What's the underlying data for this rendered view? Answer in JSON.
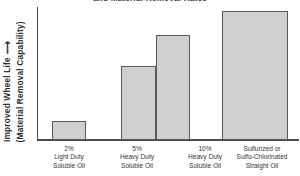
{
  "chart_data": {
    "type": "bar",
    "title": "and Material Removal Rates",
    "xlabel": "",
    "ylabel": "Improved Wheel Life ⟶ (Material Removal Capability)",
    "ylabel_lines": [
      "Improved Wheel Life",
      "(Material Removal Capability)"
    ],
    "grid": false,
    "legend": "none",
    "ylim": [
      0,
      100
    ],
    "y_axis_ticks": [],
    "categories": [
      "2% Light Duty Soluble Oil",
      "5% Heavy Duty Soluble Oil",
      "10% Heavy Duty Soluble Oil",
      "Sulfurized or Sulfo-Chlorinated Straight Oil"
    ],
    "category_label_lines": [
      [
        "2%",
        "Light Duty",
        "Soluble Oil"
      ],
      [
        "5%",
        "Heavy Duty",
        "Soluble Oil"
      ],
      [
        "10%",
        "Heavy Duty",
        "Soluble Oil"
      ],
      [
        "Sulfurized or",
        "Sulfo-Chlorinated",
        "Straight Oil"
      ]
    ],
    "values": [
      15,
      57,
      81,
      100
    ],
    "value_unit": "relative",
    "colors": {
      "bar_fill": "#cfcfcf",
      "bar_border": "#5a5a5a",
      "axis": "#4a4a4a",
      "text": "#343434",
      "background": "#ffffff"
    }
  },
  "bars": [
    {
      "name": "bar-2-percent-light-duty-soluble-oil",
      "left": 52,
      "width": 34,
      "top": 121,
      "value": 15
    },
    {
      "name": "bar-5-percent-heavy-duty-soluble-oil",
      "left": 121,
      "width": 35,
      "top": 66,
      "value": 57
    },
    {
      "name": "bar-10-percent-heavy-duty-soluble-oil",
      "left": 156,
      "width": 34,
      "top": 35,
      "value": 81
    },
    {
      "name": "bar-sulfurized-sulfo-chlorinated-straight-oil",
      "left": 222,
      "width": 66,
      "top": 11,
      "value": 100
    }
  ],
  "label_slots": [
    {
      "left": 36,
      "width": 66
    },
    {
      "left": 103,
      "width": 68
    },
    {
      "left": 172,
      "width": 66
    },
    {
      "left": 226,
      "width": 72
    }
  ]
}
